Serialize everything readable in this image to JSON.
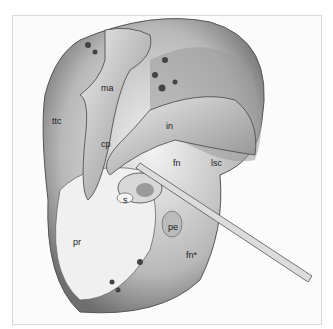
{
  "figure": {
    "type": "anatomical illustration",
    "labels": [
      {
        "id": "ma",
        "text": "ma",
        "x": 101,
        "y": 88
      },
      {
        "id": "ttc",
        "text": "ttc",
        "x": 52,
        "y": 117
      },
      {
        "id": "in",
        "text": "in",
        "x": 166,
        "y": 123
      },
      {
        "id": "cp",
        "text": "cp",
        "x": 101,
        "y": 141
      },
      {
        "id": "fn",
        "text": "fn",
        "x": 173,
        "y": 160
      },
      {
        "id": "lsc",
        "text": "lsc",
        "x": 211,
        "y": 160
      },
      {
        "id": "s",
        "text": "s",
        "x": 123,
        "y": 197
      },
      {
        "id": "pe",
        "text": "pe",
        "x": 171,
        "y": 226
      },
      {
        "id": "pr",
        "text": "pr",
        "x": 73,
        "y": 240
      },
      {
        "id": "fn-star",
        "text": "fn*",
        "x": 186,
        "y": 253
      }
    ]
  }
}
